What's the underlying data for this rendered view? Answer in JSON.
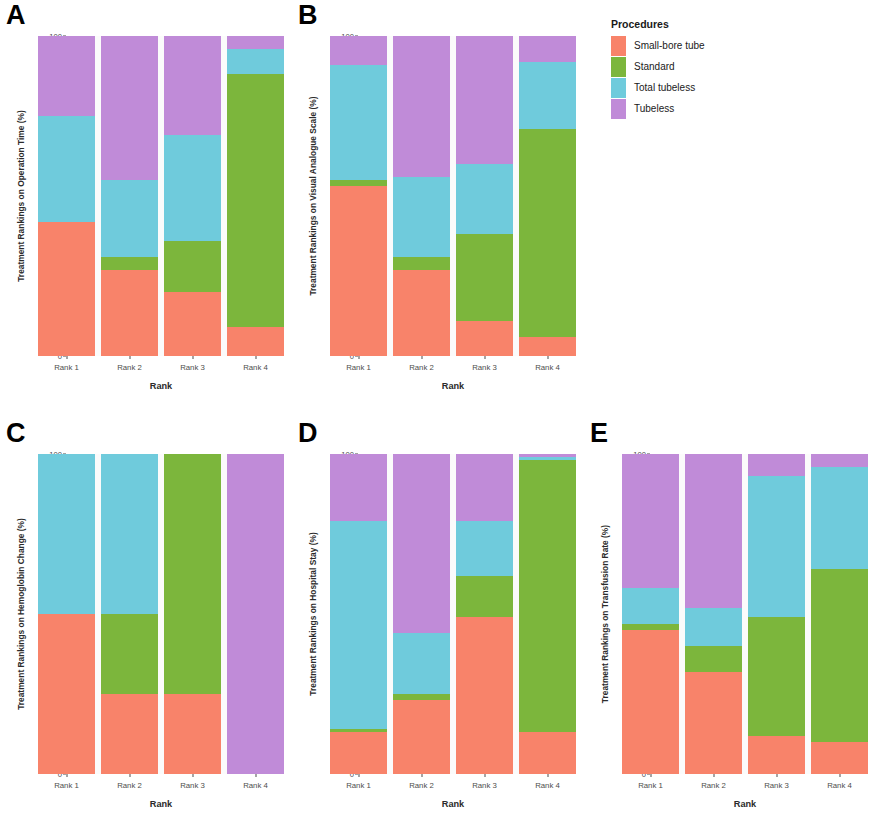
{
  "legend": {
    "title": "Procedures",
    "items": [
      {
        "label": "Small-bore tube",
        "color": "#F8836A"
      },
      {
        "label": "Standard",
        "color": "#7CB63C"
      },
      {
        "label": "Total tubeless",
        "color": "#6FCBDC"
      },
      {
        "label": "Tubeless",
        "color": "#C08BD8"
      }
    ]
  },
  "axis": {
    "x_title": "Rank",
    "x_ticks": [
      "Rank 1",
      "Rank 2",
      "Rank 3",
      "Rank 4"
    ],
    "y_ticks": [
      "0",
      "25",
      "50",
      "75",
      "100"
    ],
    "y_min": 0,
    "y_max": 100
  },
  "chart_data": [
    {
      "panel": "A",
      "type": "bar",
      "stacked": true,
      "title": "",
      "ylabel": "Treatment Rankings on Operation Time (%)",
      "xlabel": "Rank",
      "ylim": [
        0,
        100
      ],
      "grid": false,
      "legend_position": "right",
      "categories": [
        "Rank 1",
        "Rank 2",
        "Rank 3",
        "Rank 4"
      ],
      "series": [
        {
          "name": "Small-bore tube",
          "color": "#F8836A",
          "values": [
            42,
            27,
            20,
            9
          ]
        },
        {
          "name": "Standard",
          "color": "#7CB63C",
          "values": [
            0,
            4,
            16,
            79
          ]
        },
        {
          "name": "Total tubeless",
          "color": "#6FCBDC",
          "values": [
            33,
            24,
            33,
            8
          ]
        },
        {
          "name": "Tubeless",
          "color": "#C08BD8",
          "values": [
            25,
            45,
            31,
            4
          ]
        }
      ]
    },
    {
      "panel": "B",
      "type": "bar",
      "stacked": true,
      "title": "",
      "ylabel": "Treatment Rankings on Visual Analogue Scale (%)",
      "xlabel": "Rank",
      "ylim": [
        0,
        100
      ],
      "grid": false,
      "legend_position": "right",
      "categories": [
        "Rank 1",
        "Rank 2",
        "Rank 3",
        "Rank 4"
      ],
      "series": [
        {
          "name": "Small-bore tube",
          "color": "#F8836A",
          "values": [
            53,
            27,
            11,
            6
          ]
        },
        {
          "name": "Standard",
          "color": "#7CB63C",
          "values": [
            2,
            4,
            27,
            65
          ]
        },
        {
          "name": "Total tubeless",
          "color": "#6FCBDC",
          "values": [
            36,
            25,
            22,
            21
          ]
        },
        {
          "name": "Tubeless",
          "color": "#C08BD8",
          "values": [
            9,
            44,
            40,
            8
          ]
        }
      ]
    },
    {
      "panel": "C",
      "type": "bar",
      "stacked": true,
      "title": "",
      "ylabel": "Treatment Rankings on Hemoglobin Change (%)",
      "xlabel": "Rank",
      "ylim": [
        0,
        100
      ],
      "grid": false,
      "legend_position": "right",
      "categories": [
        "Rank 1",
        "Rank 2",
        "Rank 3",
        "Rank 4"
      ],
      "series": [
        {
          "name": "Small-bore tube",
          "color": "#F8836A",
          "values": [
            50,
            25,
            25,
            0
          ]
        },
        {
          "name": "Standard",
          "color": "#7CB63C",
          "values": [
            0,
            25,
            75,
            0
          ]
        },
        {
          "name": "Total tubeless",
          "color": "#6FCBDC",
          "values": [
            50,
            50,
            0,
            0
          ]
        },
        {
          "name": "Tubeless",
          "color": "#C08BD8",
          "values": [
            0,
            0,
            0,
            100
          ]
        }
      ]
    },
    {
      "panel": "D",
      "type": "bar",
      "stacked": true,
      "title": "",
      "ylabel": "Treatment Rankings on Hospital Stay (%)",
      "xlabel": "Rank",
      "ylim": [
        0,
        100
      ],
      "grid": false,
      "legend_position": "right",
      "categories": [
        "Rank 1",
        "Rank 2",
        "Rank 3",
        "Rank 4"
      ],
      "series": [
        {
          "name": "Small-bore tube",
          "color": "#F8836A",
          "values": [
            13,
            23,
            49,
            13
          ]
        },
        {
          "name": "Standard",
          "color": "#7CB63C",
          "values": [
            1,
            2,
            13,
            85
          ]
        },
        {
          "name": "Total tubeless",
          "color": "#6FCBDC",
          "values": [
            65,
            19,
            17,
            1
          ]
        },
        {
          "name": "Tubeless",
          "color": "#C08BD8",
          "values": [
            21,
            56,
            21,
            1
          ]
        }
      ]
    },
    {
      "panel": "E",
      "type": "bar",
      "stacked": true,
      "title": "",
      "ylabel": "Treatment Rankings on Transfusion Rate (%)",
      "xlabel": "Rank",
      "ylim": [
        0,
        100
      ],
      "grid": false,
      "legend_position": "right",
      "categories": [
        "Rank 1",
        "Rank 2",
        "Rank 3",
        "Rank 4"
      ],
      "series": [
        {
          "name": "Small-bore tube",
          "color": "#F8836A",
          "values": [
            45,
            32,
            12,
            10
          ]
        },
        {
          "name": "Standard",
          "color": "#7CB63C",
          "values": [
            2,
            8,
            37,
            54
          ]
        },
        {
          "name": "Total tubeless",
          "color": "#6FCBDC",
          "values": [
            11,
            12,
            44,
            32
          ]
        },
        {
          "name": "Tubeless",
          "color": "#C08BD8",
          "values": [
            42,
            48,
            7,
            4
          ]
        }
      ]
    }
  ],
  "panel_letters": [
    "A",
    "B",
    "C",
    "D",
    "E"
  ]
}
